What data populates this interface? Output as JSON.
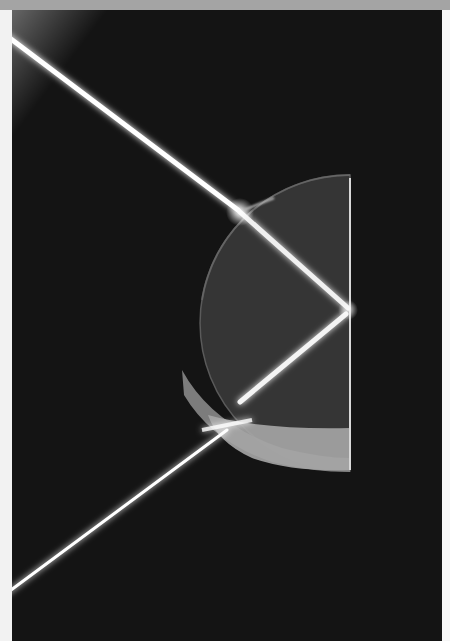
{
  "image": {
    "subject": "light beam refracting and reflecting in a semicircular glass block",
    "background_color": "#141414",
    "frame": {
      "top_band_color": "#a4a4a4",
      "side_margin_color": "#f2f2f2"
    },
    "elements": [
      {
        "name": "incident-beam",
        "from": [
          0,
          30
        ],
        "to": [
          228,
          202
        ]
      },
      {
        "name": "internal-beam",
        "from": [
          228,
          202
        ],
        "to": [
          336,
          298
        ]
      },
      {
        "name": "reflected-beam",
        "from": [
          336,
          302
        ],
        "to": [
          228,
          392
        ]
      },
      {
        "name": "exit-beam",
        "from": [
          215,
          418
        ],
        "to": [
          0,
          580
        ]
      },
      {
        "name": "semicircular-glass-block",
        "flat_face_x": 338,
        "top_y": 165,
        "bottom_y": 460
      }
    ],
    "beam_color": "#ffffff",
    "glass_color": "#3a3a3a",
    "glass_edge_color": "#a8a8a8"
  }
}
